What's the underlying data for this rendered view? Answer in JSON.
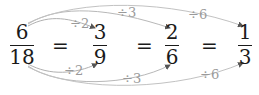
{
  "equation": {
    "fractions": [
      {
        "numerator": "6",
        "denominator": "18"
      },
      {
        "numerator": "3",
        "denominator": "9"
      },
      {
        "numerator": "2",
        "denominator": "6"
      },
      {
        "numerator": "1",
        "denominator": "3"
      }
    ],
    "equals": [
      "=",
      "=",
      "="
    ]
  },
  "arrows": {
    "top": [
      {
        "label": "÷2",
        "from": "6/18",
        "to": "3/9"
      },
      {
        "label": "÷3",
        "from": "6/18",
        "to": "2/6"
      },
      {
        "label": "÷6",
        "from": "6/18",
        "to": "1/3"
      }
    ],
    "bottom": [
      {
        "label": "÷2",
        "from": "6/18",
        "to": "3/9"
      },
      {
        "label": "÷3",
        "from": "6/18",
        "to": "2/6"
      },
      {
        "label": "÷6",
        "from": "6/18",
        "to": "1/3"
      }
    ]
  },
  "colors": {
    "text": "#1a1a1a",
    "arrow": "#a8a8a8",
    "arrow_label": "#9a9a9a"
  }
}
